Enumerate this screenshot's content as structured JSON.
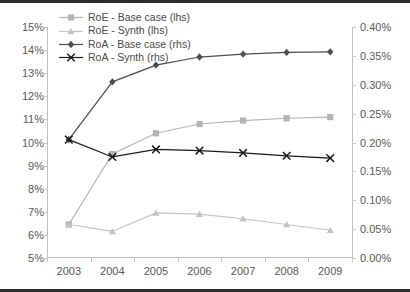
{
  "chart_data": {
    "type": "line",
    "title": "",
    "subtitle": "",
    "xlabel": "",
    "ylabel": "",
    "categories": [
      "2003",
      "2004",
      "2005",
      "2006",
      "2007",
      "2008",
      "2009"
    ],
    "x_tick_labels": [
      "2003",
      "2004",
      "2005",
      "2006",
      "2007",
      "2008",
      "2009"
    ],
    "grid": false,
    "legend_position": "top-left",
    "axes": [
      {
        "id": "left",
        "side": "lhs",
        "ylim": [
          5,
          15
        ],
        "unit": "%",
        "tick_values": [
          5,
          6,
          7,
          8,
          9,
          10,
          11,
          12,
          13,
          14,
          15
        ],
        "tick_labels": [
          "5%",
          "6%",
          "7%",
          "8%",
          "9%",
          "10%",
          "11%",
          "12%",
          "13%",
          "14%",
          "15%"
        ]
      },
      {
        "id": "right",
        "side": "rhs",
        "ylim": [
          0.0,
          0.4
        ],
        "unit": "%",
        "tick_values": [
          0.0,
          0.05,
          0.1,
          0.15,
          0.2,
          0.25,
          0.3,
          0.35,
          0.4
        ],
        "tick_labels": [
          "0.00%",
          "0.05%",
          "0.10%",
          "0.15%",
          "0.20%",
          "0.25%",
          "0.30%",
          "0.35%",
          "0.40%"
        ]
      }
    ],
    "series": [
      {
        "name": "RoE - Base case (lhs)",
        "axis": "left",
        "marker": "square",
        "color": "#b3b3b3",
        "values": [
          6.45,
          9.5,
          10.4,
          10.8,
          10.95,
          11.05,
          11.1
        ]
      },
      {
        "name": "RoE - Synth (lhs)",
        "axis": "left",
        "marker": "triangle",
        "color": "#c2c2c2",
        "values": [
          6.45,
          6.15,
          6.95,
          6.9,
          6.7,
          6.45,
          6.2
        ]
      },
      {
        "name": "RoA - Base case (rhs)",
        "axis": "right",
        "marker": "diamond",
        "color": "#4d4d4d",
        "values": [
          0.205,
          0.305,
          0.334,
          0.348,
          0.353,
          0.356,
          0.357
        ]
      },
      {
        "name": "RoA - Synth (rhs)",
        "axis": "right",
        "marker": "cross",
        "color": "#1a1a1a",
        "values": [
          0.205,
          0.175,
          0.188,
          0.186,
          0.182,
          0.177,
          0.173
        ]
      }
    ]
  },
  "legend": {
    "items": [
      {
        "label": "RoE - Base case (lhs)"
      },
      {
        "label": "RoE - Synth (lhs)"
      },
      {
        "label": "RoA - Base case (rhs)"
      },
      {
        "label": "RoA - Synth (rhs)"
      }
    ]
  },
  "colors": {
    "roe_base": "#b3b3b3",
    "roe_synth": "#c2c2c2",
    "roa_base": "#4d4d4d",
    "roa_synth": "#1a1a1a",
    "axis": "#bfbfbf",
    "tick_text": "#595959",
    "frame": "#2b2b2b"
  }
}
